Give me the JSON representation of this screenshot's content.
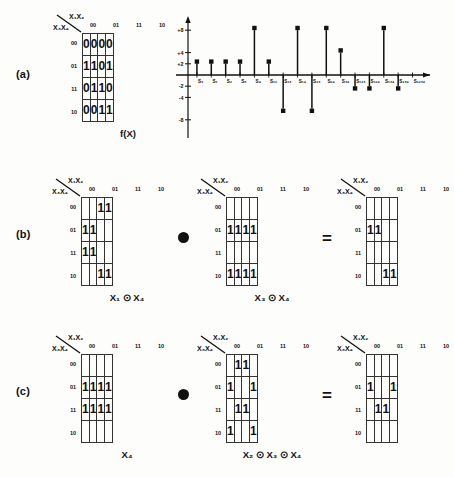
{
  "figure": {
    "parts": [
      {
        "label": "(a)"
      },
      {
        "label": "(b)"
      },
      {
        "label": "(c)"
      }
    ],
    "operator_dot": "●",
    "equals": "=",
    "xnor": "⊙"
  },
  "kmap_axis": {
    "top_label": "X₁X₂",
    "side_label": "X₃X₄",
    "columns": [
      "00",
      "01",
      "11",
      "10"
    ],
    "rows": [
      "00",
      "01",
      "11",
      "10"
    ]
  },
  "maps": {
    "a_f": {
      "caption": "f(X)",
      "cells": [
        [
          "0",
          "0",
          "0",
          "0"
        ],
        [
          "1",
          "1",
          "0",
          "1"
        ],
        [
          "0",
          "1",
          "1",
          "0"
        ],
        [
          "0",
          "0",
          "1",
          "1"
        ]
      ]
    },
    "b1": {
      "caption": "X₁ ⊙ X₄",
      "cells": [
        [
          "",
          "",
          "1",
          "1"
        ],
        [
          "1",
          "1",
          "",
          ""
        ],
        [
          "1",
          "1",
          "",
          ""
        ],
        [
          "",
          "",
          "1",
          "1"
        ]
      ]
    },
    "b2": {
      "caption": "X₃ ⊙ X₄",
      "cells": [
        [
          "",
          "",
          "",
          ""
        ],
        [
          "1",
          "1",
          "1",
          "1"
        ],
        [
          "",
          "",
          "",
          ""
        ],
        [
          "1",
          "1",
          "1",
          "1"
        ]
      ]
    },
    "b3": {
      "caption": "",
      "cells": [
        [
          "",
          "",
          "",
          ""
        ],
        [
          "1",
          "1",
          "",
          ""
        ],
        [
          "",
          "",
          "",
          ""
        ],
        [
          "",
          "",
          "1",
          "1"
        ]
      ]
    },
    "c1": {
      "caption": "X₄",
      "cells": [
        [
          "",
          "",
          "",
          ""
        ],
        [
          "1",
          "1",
          "1",
          "1"
        ],
        [
          "1",
          "1",
          "1",
          "1"
        ],
        [
          "",
          "",
          "",
          ""
        ]
      ]
    },
    "c2": {
      "caption": "X₂ ⊙ X₃ ⊙ X₄",
      "cells": [
        [
          "",
          "1",
          "1",
          ""
        ],
        [
          "1",
          "",
          "",
          "1"
        ],
        [
          "",
          "1",
          "1",
          ""
        ],
        [
          "1",
          "",
          "",
          "1"
        ]
      ]
    },
    "c3": {
      "caption": "",
      "cells": [
        [
          "",
          "",
          "",
          ""
        ],
        [
          "1",
          "",
          "",
          "1"
        ],
        [
          "",
          "1",
          "1",
          ""
        ],
        [
          "",
          "",
          "",
          ""
        ]
      ]
    }
  },
  "chart_data": {
    "type": "bar",
    "title": "",
    "xlabel": "",
    "ylabel": "",
    "ylim": [
      -8,
      8
    ],
    "grid": false,
    "legend": null,
    "yticks": [
      "+8",
      "+4",
      "+2",
      "-2",
      "-4",
      "-8"
    ],
    "ytick_values": [
      8,
      4,
      2,
      -2,
      -4,
      -8
    ],
    "categories": [
      "S₀",
      "S₁",
      "S₂",
      "S₃",
      "S₄",
      "S₁₂",
      "S₁₃",
      "S₁₄",
      "S₂₃",
      "S₂₄",
      "S₃₄",
      "S₁₂₃",
      "S₁₂₄",
      "S₁₃₄",
      "S₂₃₄",
      "S₁₂₃₄"
    ],
    "values": [
      2,
      2,
      2,
      2,
      8,
      2,
      -6,
      8,
      -6,
      8,
      4,
      -2,
      -2,
      8,
      -2,
      0
    ]
  }
}
